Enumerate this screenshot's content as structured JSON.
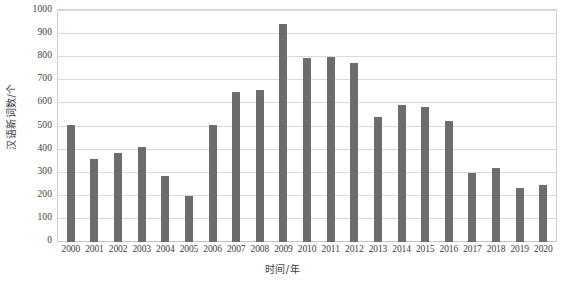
{
  "chart_data": {
    "type": "bar",
    "title": "",
    "xlabel": "时间/年",
    "ylabel": "汉语新词数/个",
    "ylim": [
      0,
      1000
    ],
    "ytick_step": 100,
    "grid": true,
    "legend": "none",
    "bar_color": "#6d6d6d",
    "gridline_color": "#d9d9d9",
    "frame_color": "#d2d2d2",
    "background_color": "#ffffff",
    "categories": [
      "2000",
      "2001",
      "2002",
      "2003",
      "2004",
      "2005",
      "2006",
      "2007",
      "2008",
      "2009",
      "2010",
      "2011",
      "2012",
      "2013",
      "2014",
      "2015",
      "2016",
      "2017",
      "2018",
      "2019",
      "2020"
    ],
    "values": [
      505,
      360,
      385,
      410,
      285,
      200,
      505,
      650,
      660,
      945,
      795,
      800,
      775,
      540,
      595,
      585,
      525,
      300,
      320,
      235,
      245
    ],
    "yticks": [
      "0",
      "100",
      "200",
      "300",
      "400",
      "500",
      "600",
      "700",
      "800",
      "900",
      "1000"
    ]
  }
}
